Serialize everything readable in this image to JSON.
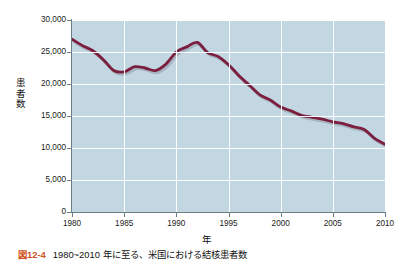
{
  "figure": {
    "caption_number": "図12-4",
    "caption_text": "1980~2010 年に至る、米国における結核患者数"
  },
  "chart_data": {
    "type": "line",
    "title": "",
    "xlabel": "年",
    "ylabel": "患者数",
    "xlim": [
      1980,
      2010
    ],
    "ylim": [
      0,
      30000
    ],
    "grid": true,
    "legend": "none",
    "line_color": "#7c1f3f",
    "plot_background": "#c3d7e2",
    "gridline_color": "#ffffff",
    "xticks": [
      1980,
      1985,
      1990,
      1995,
      2000,
      2005,
      2010
    ],
    "xtick_labels": [
      "1980",
      "1985",
      "1990",
      "1995",
      "2000",
      "2005",
      "2010"
    ],
    "yticks": [
      0,
      5000,
      10000,
      15000,
      20000,
      25000,
      30000
    ],
    "ytick_labels": [
      "0",
      "5,000",
      "10,000",
      "15,000",
      "20,000",
      "25,000",
      "30,000"
    ],
    "x": [
      1980,
      1981,
      1982,
      1983,
      1984,
      1985,
      1986,
      1987,
      1988,
      1989,
      1990,
      1991,
      1992,
      1993,
      1994,
      1995,
      1996,
      1997,
      1998,
      1999,
      2000,
      2001,
      2002,
      2003,
      2004,
      2005,
      2006,
      2007,
      2008,
      2009,
      2010
    ],
    "series": [
      {
        "name": "患者数",
        "values": [
          27000,
          26000,
          25200,
          23800,
          22100,
          21900,
          22700,
          22500,
          22100,
          23100,
          25000,
          25800,
          26500,
          24900,
          24300,
          23000,
          21300,
          19800,
          18300,
          17500,
          16400,
          15800,
          15100,
          14800,
          14500,
          14100,
          13800,
          13300,
          12900,
          11500,
          10600
        ]
      }
    ]
  }
}
